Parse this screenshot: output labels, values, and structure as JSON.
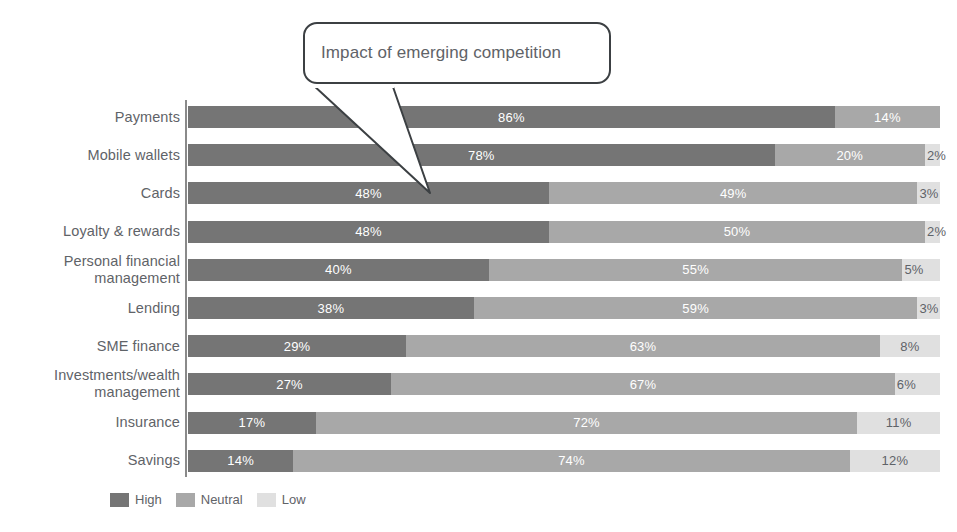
{
  "callout": {
    "text": "Impact of emerging competition",
    "name": "callout-annotation"
  },
  "legend": {
    "items": [
      {
        "label": "High",
        "color": "#757575"
      },
      {
        "label": "Neutral",
        "color": "#a8a8a8"
      },
      {
        "label": "Low",
        "color": "#e0e0e0"
      }
    ]
  },
  "colors": {
    "high": "#757575",
    "neutral": "#a8a8a8",
    "low": "#e0e0e0",
    "axis": "#8a8a8a",
    "label_text": "#5f6368",
    "callout_border": "#3c4043"
  },
  "chart_data": {
    "type": "bar",
    "orientation": "horizontal",
    "stacked": true,
    "normalized_percent": true,
    "title": "",
    "subtitle": "",
    "xlabel": "",
    "ylabel": "",
    "xlim": [
      0,
      100
    ],
    "grid": false,
    "legend_position": "bottom-left",
    "annotations": [
      {
        "text": "Impact of emerging competition",
        "points_to": "Cards"
      }
    ],
    "categories": [
      "Payments",
      "Mobile wallets",
      "Cards",
      "Loyalty & rewards",
      "Personal financial management",
      "Lending",
      "SME finance",
      "Investments/wealth management",
      "Insurance",
      "Savings"
    ],
    "series": [
      {
        "name": "High",
        "values": [
          86,
          78,
          48,
          48,
          40,
          38,
          29,
          27,
          17,
          14
        ]
      },
      {
        "name": "Neutral",
        "values": [
          14,
          20,
          49,
          50,
          55,
          59,
          63,
          67,
          72,
          74
        ]
      },
      {
        "name": "Low",
        "values": [
          0,
          2,
          3,
          2,
          5,
          3,
          8,
          6,
          11,
          12
        ]
      }
    ]
  },
  "rows": [
    {
      "label": "Payments",
      "label_lines": [
        "Payments"
      ],
      "segments": [
        {
          "series": "High",
          "value": 86,
          "text": "86%",
          "color": "#757575",
          "text_color": "light"
        },
        {
          "series": "Neutral",
          "value": 14,
          "text": "14%",
          "color": "#a8a8a8",
          "text_color": "light"
        },
        {
          "series": "Low",
          "value": 0,
          "text": "",
          "color": "#e0e0e0",
          "text_color": "dark"
        }
      ]
    },
    {
      "label": "Mobile wallets",
      "label_lines": [
        "Mobile wallets"
      ],
      "segments": [
        {
          "series": "High",
          "value": 78,
          "text": "78%",
          "color": "#757575",
          "text_color": "light"
        },
        {
          "series": "Neutral",
          "value": 20,
          "text": "20%",
          "color": "#a8a8a8",
          "text_color": "light"
        },
        {
          "series": "Low",
          "value": 2,
          "text": "2%",
          "color": "#e0e0e0",
          "text_color": "dark"
        }
      ]
    },
    {
      "label": "Cards",
      "label_lines": [
        "Cards"
      ],
      "segments": [
        {
          "series": "High",
          "value": 48,
          "text": "48%",
          "color": "#757575",
          "text_color": "light"
        },
        {
          "series": "Neutral",
          "value": 49,
          "text": "49%",
          "color": "#a8a8a8",
          "text_color": "light"
        },
        {
          "series": "Low",
          "value": 3,
          "text": "3%",
          "color": "#e0e0e0",
          "text_color": "dark"
        }
      ]
    },
    {
      "label": "Loyalty & rewards",
      "label_lines": [
        "Loyalty & rewards"
      ],
      "segments": [
        {
          "series": "High",
          "value": 48,
          "text": "48%",
          "color": "#757575",
          "text_color": "light"
        },
        {
          "series": "Neutral",
          "value": 50,
          "text": "50%",
          "color": "#a8a8a8",
          "text_color": "light"
        },
        {
          "series": "Low",
          "value": 2,
          "text": "2%",
          "color": "#e0e0e0",
          "text_color": "dark"
        }
      ]
    },
    {
      "label": "Personal financial management",
      "label_lines": [
        "Personal financial",
        "management"
      ],
      "segments": [
        {
          "series": "High",
          "value": 40,
          "text": "40%",
          "color": "#757575",
          "text_color": "light"
        },
        {
          "series": "Neutral",
          "value": 55,
          "text": "55%",
          "color": "#a8a8a8",
          "text_color": "light"
        },
        {
          "series": "Low",
          "value": 5,
          "text": "5%",
          "color": "#e0e0e0",
          "text_color": "dark"
        }
      ]
    },
    {
      "label": "Lending",
      "label_lines": [
        "Lending"
      ],
      "segments": [
        {
          "series": "High",
          "value": 38,
          "text": "38%",
          "color": "#757575",
          "text_color": "light"
        },
        {
          "series": "Neutral",
          "value": 59,
          "text": "59%",
          "color": "#a8a8a8",
          "text_color": "light"
        },
        {
          "series": "Low",
          "value": 3,
          "text": "3%",
          "color": "#e0e0e0",
          "text_color": "dark"
        }
      ]
    },
    {
      "label": "SME finance",
      "label_lines": [
        "SME finance"
      ],
      "segments": [
        {
          "series": "High",
          "value": 29,
          "text": "29%",
          "color": "#757575",
          "text_color": "light"
        },
        {
          "series": "Neutral",
          "value": 63,
          "text": "63%",
          "color": "#a8a8a8",
          "text_color": "light"
        },
        {
          "series": "Low",
          "value": 8,
          "text": "8%",
          "color": "#e0e0e0",
          "text_color": "dark"
        }
      ]
    },
    {
      "label": "Investments/wealth management",
      "label_lines": [
        "Investments/wealth",
        "management"
      ],
      "segments": [
        {
          "series": "High",
          "value": 27,
          "text": "27%",
          "color": "#757575",
          "text_color": "light"
        },
        {
          "series": "Neutral",
          "value": 67,
          "text": "67%",
          "color": "#a8a8a8",
          "text_color": "light"
        },
        {
          "series": "Low",
          "value": 6,
          "text": "6%",
          "color": "#e0e0e0",
          "text_color": "dark"
        }
      ]
    },
    {
      "label": "Insurance",
      "label_lines": [
        "Insurance"
      ],
      "segments": [
        {
          "series": "High",
          "value": 17,
          "text": "17%",
          "color": "#757575",
          "text_color": "light"
        },
        {
          "series": "Neutral",
          "value": 72,
          "text": "72%",
          "color": "#a8a8a8",
          "text_color": "light"
        },
        {
          "series": "Low",
          "value": 11,
          "text": "11%",
          "color": "#e0e0e0",
          "text_color": "dark"
        }
      ]
    },
    {
      "label": "Savings",
      "label_lines": [
        "Savings"
      ],
      "segments": [
        {
          "series": "High",
          "value": 14,
          "text": "14%",
          "color": "#757575",
          "text_color": "light"
        },
        {
          "series": "Neutral",
          "value": 74,
          "text": "74%",
          "color": "#a8a8a8",
          "text_color": "light"
        },
        {
          "series": "Low",
          "value": 12,
          "text": "12%",
          "color": "#e0e0e0",
          "text_color": "dark"
        }
      ]
    }
  ]
}
